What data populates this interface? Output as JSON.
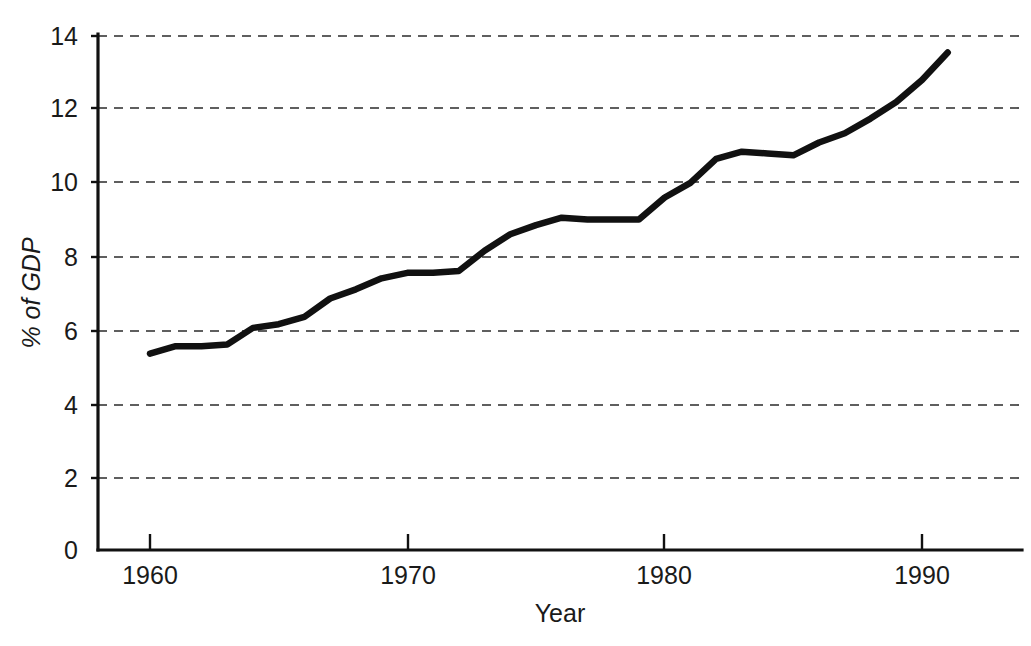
{
  "chart_data": {
    "type": "line",
    "title": "",
    "xlabel": "Year",
    "ylabel": "% of GDP",
    "ylim": [
      0,
      14
    ],
    "xlim": [
      1959,
      1993
    ],
    "grid": true,
    "legend_position": "none",
    "y_ticks": [
      "0",
      "2",
      "4",
      "6",
      "8",
      "10",
      "12",
      "14"
    ],
    "y_tick_values": [
      0,
      2,
      4,
      6,
      8,
      10,
      12,
      14
    ],
    "x_ticks": [
      "1960",
      "1970",
      "1980",
      "1990"
    ],
    "x_tick_values": [
      1960,
      1970,
      1980,
      1990
    ],
    "x": [
      1960,
      1961,
      1962,
      1963,
      1964,
      1965,
      1966,
      1967,
      1968,
      1969,
      1970,
      1971,
      1972,
      1973,
      1974,
      1975,
      1976,
      1977,
      1978,
      1979,
      1980,
      1981,
      1982,
      1983,
      1984,
      1985,
      1986,
      1987,
      1988,
      1989,
      1990,
      1991
    ],
    "series": [
      {
        "name": "% of GDP",
        "color": "#111111",
        "values": [
          5.35,
          5.55,
          5.55,
          5.6,
          6.05,
          6.15,
          6.35,
          6.85,
          7.1,
          7.4,
          7.55,
          7.55,
          7.6,
          8.15,
          8.6,
          8.85,
          9.05,
          9.0,
          9.0,
          9.0,
          9.6,
          10.0,
          10.65,
          10.85,
          10.8,
          10.75,
          11.1,
          11.35,
          11.75,
          12.2,
          12.8,
          13.55
        ]
      }
    ]
  },
  "axes": {
    "y_label": "% of GDP",
    "x_label": "Year",
    "y_tick_0": "0",
    "y_tick_1": "2",
    "y_tick_2": "4",
    "y_tick_3": "6",
    "y_tick_4": "8",
    "y_tick_5": "10",
    "y_tick_6": "12",
    "y_tick_7": "14",
    "x_tick_0": "1960",
    "x_tick_1": "1970",
    "x_tick_2": "1980",
    "x_tick_3": "1990"
  },
  "colors": {
    "line": "#111111",
    "axis": "#111111",
    "grid": "#2b2b2b",
    "background": "#ffffff"
  }
}
